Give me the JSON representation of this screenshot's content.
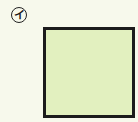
{
  "figure": {
    "label": "イ",
    "shape": "square",
    "fill_color": "#e2f0bf",
    "border_color": "#1c1c1c",
    "background_color": "#f7f9ec"
  }
}
